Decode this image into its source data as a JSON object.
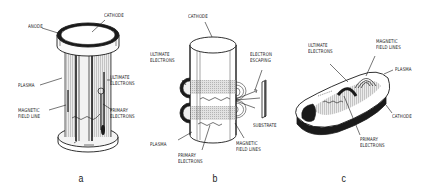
{
  "figure": {
    "panels": [
      {
        "id": "a",
        "caption": "a",
        "labels": {
          "anode": "ANODE",
          "cathode": "CATHODE",
          "plasma": "PLASMA",
          "ultimate_electrons_1": "ULTIMATE",
          "ultimate_electrons_2": "ELECTRONS",
          "magnetic_field_line_1": "MAGNETIC",
          "magnetic_field_line_2": "FIELD LINE",
          "primary_electrons_1": "PRIMARY",
          "primary_electrons_2": "ELECTRONS"
        }
      },
      {
        "id": "b",
        "caption": "b",
        "labels": {
          "cathode": "CATHODE",
          "ultimate_electrons_1": "ULTIMATE",
          "ultimate_electrons_2": "ELECTRONS",
          "electron_escaping_1": "ELECTRON",
          "electron_escaping_2": "ESCAPING",
          "substrate": "SUBSTRATE",
          "plasma": "PLASMA",
          "magnetic_field_lines_1": "MAGNETIC",
          "magnetic_field_lines_2": "FIELD LINES",
          "primary_electrons_1": "PRIMARY",
          "primary_electrons_2": "ELECTRONS"
        }
      },
      {
        "id": "c",
        "caption": "c",
        "labels": {
          "ultimate_electrons_1": "ULTIMATE",
          "ultimate_electrons_2": "ELECTRONS",
          "magnetic_field_lines_1": "MAGNETIC",
          "magnetic_field_lines_2": "FIELD LINES",
          "plasma": "PLASMA",
          "cathode": "CATHODE",
          "primary_electrons_1": "PRIMARY",
          "primary_electrons_2": "ELECTRONS"
        }
      }
    ],
    "colors": {
      "ink": "#1a1a1a",
      "plasma": "#cfcfcf",
      "background": "#ffffff"
    }
  }
}
